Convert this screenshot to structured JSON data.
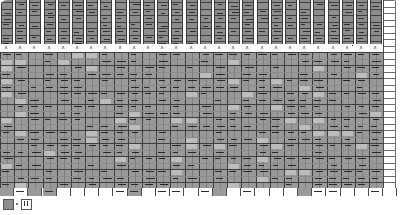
{
  "app": {
    "title": "Spreadsheet Grid",
    "view": "zoomed-out-worksheet"
  },
  "grid": {
    "total_columns": 28,
    "total_rows": 30,
    "column_pitch_px": 14.2,
    "row_pitch_px": 6.5,
    "header_band_rows": 7,
    "marker_row_index": 8,
    "marker_glyph": "ʌ",
    "blank_column_index": 27,
    "blank_column_label": "",
    "bottom_blank_row_index": 29
  },
  "colors": {
    "cell_fill_upper": "#8c8c8c",
    "cell_fill_lower": "#9a9a9a",
    "gridline_dark": "#3c3c3c",
    "gridline_light": "#8a8a8a",
    "text_bar": "#262626",
    "page_background": "#ffffff",
    "highlight": "#bdbdbd"
  },
  "toolbar": {
    "items": [
      {
        "name": "stop-button",
        "icon": "filled-square-icon",
        "label": ""
      },
      {
        "name": "pause-button",
        "icon": "pause-icon",
        "label": ""
      }
    ]
  },
  "chart_data": {
    "type": "heatmap",
    "title": "",
    "xlabel": "",
    "ylabel": "",
    "legend": [],
    "columns": [
      "C1",
      "C2",
      "C3",
      "C4",
      "C5",
      "C6",
      "C7",
      "C8",
      "C9",
      "C10",
      "C11",
      "C12",
      "C13",
      "C14",
      "C15",
      "C16",
      "C17",
      "C18",
      "C19",
      "C20",
      "C21",
      "C22",
      "C23",
      "C24",
      "C25",
      "C26",
      "C27",
      "C28"
    ],
    "rows": [
      "R1",
      "R2",
      "R3",
      "R4",
      "R5",
      "R6",
      "R7",
      "R8",
      "R9",
      "R10",
      "R11",
      "R12",
      "R13",
      "R14",
      "R15",
      "R16",
      "R17",
      "R18",
      "R19",
      "R20",
      "R21",
      "R22",
      "R23",
      "R24",
      "R25",
      "R26",
      "R27",
      "R28",
      "R29",
      "R30"
    ],
    "density": [
      [
        1,
        1,
        1,
        1,
        1,
        1,
        1,
        1,
        1,
        1,
        1,
        1,
        1,
        1,
        1,
        1,
        1,
        1,
        1,
        1,
        1,
        1,
        1,
        1,
        1,
        1,
        1,
        0
      ],
      [
        1,
        1,
        1,
        1,
        1,
        1,
        1,
        1,
        1,
        1,
        1,
        1,
        1,
        1,
        1,
        1,
        1,
        1,
        1,
        1,
        1,
        1,
        1,
        1,
        1,
        1,
        1,
        0
      ],
      [
        1,
        1,
        1,
        1,
        1,
        1,
        1,
        1,
        1,
        1,
        1,
        1,
        1,
        1,
        1,
        1,
        1,
        1,
        1,
        1,
        1,
        1,
        1,
        1,
        1,
        1,
        1,
        0
      ],
      [
        1,
        1,
        1,
        1,
        1,
        1,
        1,
        1,
        1,
        1,
        1,
        1,
        1,
        1,
        1,
        1,
        1,
        1,
        1,
        1,
        1,
        1,
        1,
        1,
        1,
        1,
        1,
        0
      ],
      [
        1,
        1,
        1,
        1,
        1,
        1,
        1,
        1,
        1,
        1,
        1,
        1,
        1,
        1,
        1,
        1,
        1,
        1,
        1,
        1,
        1,
        1,
        1,
        1,
        1,
        1,
        1,
        0
      ],
      [
        1,
        1,
        1,
        1,
        1,
        1,
        1,
        1,
        1,
        1,
        1,
        1,
        1,
        1,
        1,
        1,
        1,
        1,
        1,
        1,
        1,
        1,
        1,
        1,
        1,
        1,
        1,
        0
      ],
      [
        1,
        1,
        1,
        1,
        1,
        1,
        1,
        1,
        1,
        1,
        1,
        1,
        1,
        1,
        1,
        1,
        1,
        1,
        1,
        1,
        1,
        1,
        1,
        1,
        1,
        1,
        1,
        0
      ],
      [
        0,
        0,
        0,
        0,
        0,
        0,
        0,
        0,
        0,
        0,
        0,
        0,
        0,
        0,
        0,
        0,
        0,
        0,
        0,
        0,
        0,
        0,
        0,
        0,
        0,
        0,
        0,
        0
      ],
      [
        1,
        1,
        1,
        1,
        1,
        1,
        1,
        1,
        1,
        1,
        1,
        1,
        1,
        1,
        1,
        1,
        1,
        1,
        1,
        1,
        1,
        1,
        1,
        1,
        1,
        1,
        1,
        0
      ],
      [
        1,
        1,
        1,
        1,
        1,
        1,
        1,
        1,
        1,
        1,
        1,
        1,
        1,
        1,
        1,
        1,
        1,
        1,
        1,
        1,
        1,
        1,
        1,
        1,
        1,
        1,
        1,
        0
      ],
      [
        1,
        1,
        1,
        1,
        1,
        1,
        1,
        1,
        1,
        1,
        1,
        1,
        1,
        1,
        1,
        1,
        1,
        1,
        1,
        1,
        1,
        1,
        1,
        1,
        1,
        1,
        1,
        0
      ],
      [
        1,
        1,
        1,
        1,
        1,
        1,
        1,
        1,
        1,
        1,
        1,
        1,
        1,
        1,
        1,
        1,
        1,
        1,
        1,
        1,
        1,
        1,
        1,
        1,
        1,
        1,
        1,
        0
      ],
      [
        1,
        1,
        1,
        1,
        1,
        1,
        1,
        1,
        1,
        1,
        1,
        1,
        1,
        1,
        1,
        1,
        1,
        1,
        1,
        1,
        1,
        1,
        1,
        1,
        1,
        1,
        1,
        0
      ],
      [
        1,
        1,
        1,
        1,
        1,
        1,
        1,
        1,
        1,
        1,
        1,
        1,
        1,
        1,
        1,
        1,
        1,
        1,
        1,
        1,
        1,
        1,
        1,
        1,
        1,
        1,
        1,
        0
      ],
      [
        1,
        1,
        1,
        1,
        1,
        1,
        1,
        1,
        1,
        1,
        1,
        1,
        1,
        1,
        1,
        1,
        1,
        1,
        1,
        1,
        1,
        1,
        1,
        1,
        1,
        1,
        1,
        0
      ],
      [
        1,
        1,
        1,
        1,
        1,
        1,
        1,
        1,
        1,
        1,
        1,
        1,
        1,
        1,
        1,
        1,
        1,
        1,
        1,
        1,
        1,
        1,
        1,
        1,
        1,
        1,
        1,
        0
      ],
      [
        1,
        1,
        1,
        1,
        1,
        1,
        1,
        1,
        1,
        1,
        1,
        1,
        1,
        1,
        1,
        1,
        1,
        1,
        1,
        1,
        1,
        1,
        1,
        1,
        1,
        1,
        1,
        0
      ],
      [
        1,
        1,
        1,
        1,
        1,
        1,
        1,
        1,
        1,
        1,
        1,
        1,
        1,
        1,
        1,
        1,
        1,
        1,
        1,
        1,
        1,
        1,
        1,
        1,
        1,
        1,
        1,
        0
      ],
      [
        1,
        1,
        1,
        1,
        1,
        1,
        1,
        1,
        1,
        1,
        1,
        1,
        1,
        1,
        1,
        1,
        1,
        1,
        1,
        1,
        1,
        1,
        1,
        1,
        1,
        1,
        1,
        0
      ],
      [
        1,
        1,
        1,
        1,
        1,
        1,
        1,
        1,
        1,
        1,
        1,
        1,
        1,
        1,
        1,
        1,
        1,
        1,
        1,
        1,
        1,
        1,
        1,
        1,
        1,
        1,
        1,
        0
      ],
      [
        1,
        1,
        1,
        1,
        1,
        1,
        1,
        1,
        1,
        1,
        1,
        1,
        1,
        1,
        1,
        1,
        1,
        1,
        1,
        1,
        1,
        1,
        1,
        1,
        1,
        1,
        1,
        0
      ],
      [
        1,
        1,
        1,
        1,
        1,
        1,
        1,
        1,
        1,
        1,
        1,
        1,
        1,
        1,
        1,
        1,
        1,
        1,
        1,
        1,
        1,
        1,
        1,
        1,
        1,
        1,
        1,
        0
      ],
      [
        1,
        1,
        1,
        1,
        1,
        1,
        1,
        1,
        1,
        1,
        1,
        1,
        1,
        1,
        1,
        1,
        1,
        1,
        1,
        1,
        1,
        1,
        1,
        1,
        1,
        1,
        1,
        0
      ],
      [
        1,
        1,
        1,
        1,
        1,
        1,
        1,
        1,
        1,
        1,
        1,
        1,
        1,
        1,
        1,
        1,
        1,
        1,
        1,
        1,
        1,
        1,
        1,
        1,
        1,
        1,
        1,
        0
      ],
      [
        1,
        1,
        1,
        1,
        1,
        1,
        1,
        1,
        1,
        1,
        1,
        1,
        1,
        1,
        1,
        1,
        1,
        1,
        1,
        1,
        1,
        1,
        1,
        1,
        1,
        1,
        1,
        0
      ],
      [
        1,
        1,
        1,
        1,
        1,
        1,
        1,
        1,
        1,
        1,
        1,
        1,
        1,
        1,
        1,
        1,
        1,
        1,
        1,
        1,
        1,
        1,
        1,
        1,
        1,
        1,
        1,
        0
      ],
      [
        1,
        1,
        1,
        1,
        1,
        1,
        1,
        1,
        1,
        1,
        1,
        1,
        1,
        1,
        1,
        1,
        1,
        1,
        1,
        1,
        1,
        1,
        1,
        1,
        1,
        1,
        1,
        0
      ],
      [
        1,
        1,
        1,
        1,
        1,
        1,
        1,
        1,
        1,
        1,
        1,
        1,
        1,
        1,
        1,
        1,
        1,
        1,
        1,
        1,
        1,
        1,
        1,
        1,
        1,
        1,
        1,
        0
      ],
      [
        1,
        1,
        1,
        1,
        1,
        1,
        1,
        1,
        1,
        1,
        1,
        1,
        1,
        1,
        1,
        1,
        1,
        1,
        1,
        1,
        1,
        1,
        1,
        1,
        1,
        1,
        1,
        0
      ],
      [
        0,
        0,
        0,
        0,
        0,
        0,
        0,
        0,
        0,
        0,
        0,
        0,
        0,
        0,
        0,
        0,
        0,
        0,
        0,
        0,
        0,
        0,
        0,
        0,
        0,
        0,
        0,
        0
      ]
    ]
  }
}
